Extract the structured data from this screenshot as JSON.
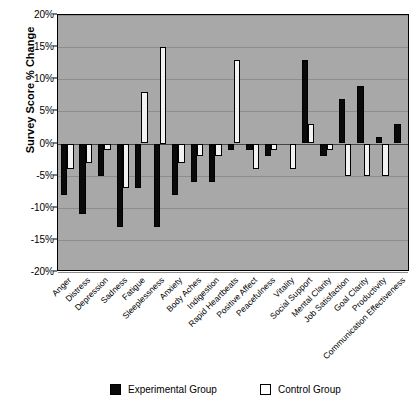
{
  "chart_data": {
    "type": "bar",
    "title": "",
    "xlabel": "",
    "ylabel": "Survey Score % Change",
    "ylim": [
      -20,
      20
    ],
    "ytick_labels": [
      "20%",
      "15%",
      "10%",
      "5%",
      "0%",
      "-5%",
      "-10%",
      "-15%",
      "-20%"
    ],
    "ytick_values": [
      20,
      15,
      10,
      5,
      0,
      -5,
      -10,
      -15,
      -20
    ],
    "grid": true,
    "legend_position": "bottom",
    "categories": [
      "Anger",
      "Distress",
      "Depression",
      "Sadness",
      "Fatigue",
      "Sleeplessness",
      "Anxiety",
      "Body Aches",
      "Indigestion",
      "Rapid Heartbeats",
      "Positive Affect",
      "Peacefulness",
      "Vitality",
      "Social Support",
      "Mental Clarity",
      "Job Satisfaction",
      "Goal Clarity",
      "Productivity",
      "Communication Effectiveness"
    ],
    "series": [
      {
        "name": "Experimental Group",
        "color": "#0a0a0a",
        "values": [
          -8,
          -11,
          -5,
          -13,
          -7,
          -13,
          -8,
          -6,
          -6,
          -1,
          -1,
          -2,
          0,
          13,
          -2,
          7,
          9,
          1,
          3
        ]
      },
      {
        "name": "Control Group",
        "color": "#ffffff",
        "values": [
          -4,
          -3,
          -1,
          -7,
          8,
          15,
          -3,
          -2,
          -2,
          13,
          -4,
          -1,
          -4,
          3,
          -1,
          -5,
          -5,
          -5,
          0
        ]
      }
    ]
  },
  "legend": {
    "entries": [
      {
        "label": "Experimental Group",
        "swatch": "black-square-icon"
      },
      {
        "label": "Control Group",
        "swatch": "white-square-icon"
      }
    ]
  }
}
